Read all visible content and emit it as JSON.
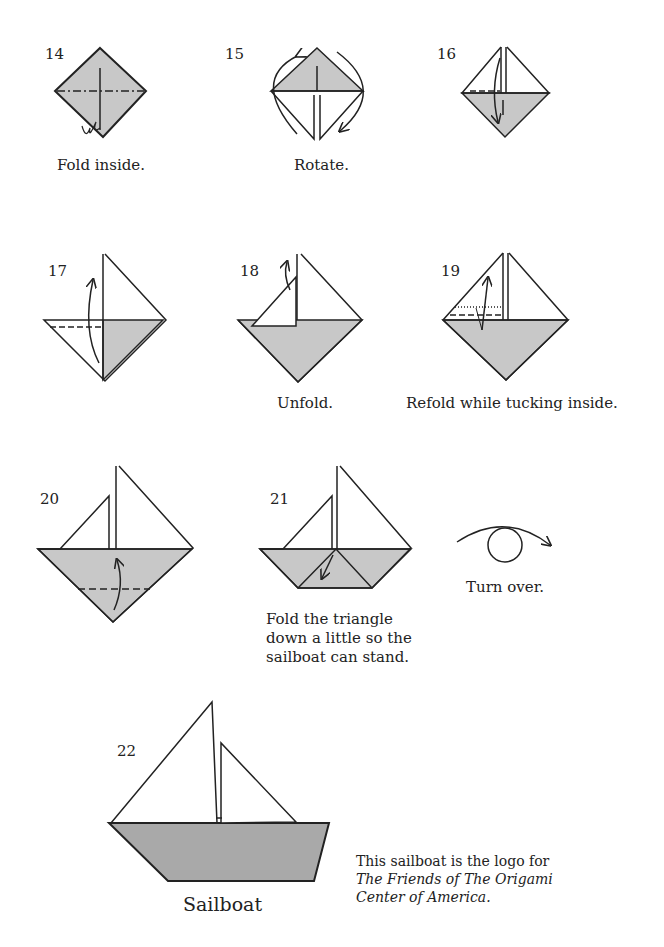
{
  "steps": [
    {
      "num": "14",
      "caption": "Fold inside."
    },
    {
      "num": "15",
      "caption": "Rotate."
    },
    {
      "num": "16",
      "caption": ""
    },
    {
      "num": "17",
      "caption": ""
    },
    {
      "num": "18",
      "caption": "Unfold."
    },
    {
      "num": "19",
      "caption": "Refold while tucking inside."
    },
    {
      "num": "20",
      "caption": ""
    },
    {
      "num": "21",
      "caption": "Fold the triangle down a little so the sailboat can stand."
    },
    {
      "num": "22",
      "caption": ""
    }
  ],
  "turn_over": {
    "caption": "Turn over."
  },
  "final": {
    "title": "Sailboat"
  },
  "note": {
    "line1": "This sailboat is the logo for",
    "line2": "The Friends of The Origami",
    "line3": "Center of America."
  },
  "colors": {
    "paper_gray": "#c8c8c8",
    "boat_gray": "#a9a9a9",
    "line": "#2a2a2a"
  }
}
